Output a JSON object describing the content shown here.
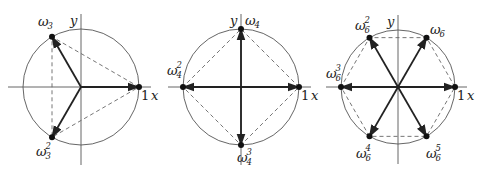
{
  "figure": {
    "style": {
      "axis_color": "#555555",
      "circle_color": "#555555",
      "vector_color": "#222222",
      "dashed_color": "#666666",
      "point_color": "#111111"
    },
    "diagrams": [
      {
        "name": "cube-roots-of-unity",
        "n": 3,
        "center": [
          81,
          87
        ],
        "radius": 58,
        "axis_x_label": "x",
        "axis_y_label": "y",
        "one_label": "1",
        "points": [
          {
            "angle_deg": 0,
            "label": "",
            "sub": "",
            "sup": ""
          },
          {
            "angle_deg": 120,
            "label": "ω",
            "sub": "3",
            "sup": "",
            "lx": 38,
            "ly": 26
          },
          {
            "angle_deg": 240,
            "label": "ω",
            "sub": "3",
            "sup": "2",
            "lx": 36,
            "ly": 156
          }
        ]
      },
      {
        "name": "fourth-roots-of-unity",
        "n": 4,
        "center": [
          241,
          87
        ],
        "radius": 58,
        "axis_x_label": "x",
        "axis_y_label": "y",
        "one_label": "1",
        "points": [
          {
            "angle_deg": 0,
            "label": "",
            "sub": "",
            "sup": ""
          },
          {
            "angle_deg": 90,
            "label": "ω",
            "sub": "4",
            "sup": "",
            "lx": 245,
            "ly": 25
          },
          {
            "angle_deg": 180,
            "label": "ω",
            "sub": "4",
            "sup": "2",
            "lx": 167,
            "ly": 75
          },
          {
            "angle_deg": 270,
            "label": "ω",
            "sub": "4",
            "sup": "3",
            "lx": 237,
            "ly": 162
          }
        ]
      },
      {
        "name": "sixth-roots-of-unity",
        "n": 6,
        "center": [
          398,
          87
        ],
        "radius": 57,
        "axis_x_label": "x",
        "axis_y_label": "y",
        "one_label": "1",
        "points": [
          {
            "angle_deg": 0,
            "label": "",
            "sub": "",
            "sup": ""
          },
          {
            "angle_deg": 60,
            "label": "ω",
            "sub": "6",
            "sup": "",
            "lx": 430,
            "ly": 34
          },
          {
            "angle_deg": 120,
            "label": "ω",
            "sub": "6",
            "sup": "2",
            "lx": 355,
            "ly": 30
          },
          {
            "angle_deg": 180,
            "label": "ω",
            "sub": "6",
            "sup": "3",
            "lx": 326,
            "ly": 78
          },
          {
            "angle_deg": 240,
            "label": "ω",
            "sub": "6",
            "sup": "4",
            "lx": 356,
            "ly": 158
          },
          {
            "angle_deg": 300,
            "label": "ω",
            "sub": "6",
            "sup": "5",
            "lx": 426,
            "ly": 158
          }
        ]
      }
    ]
  }
}
